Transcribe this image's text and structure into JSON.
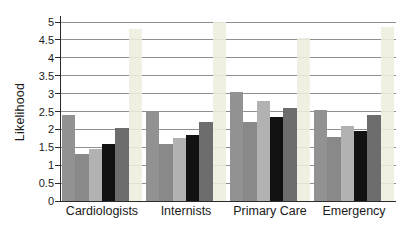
{
  "chart_data": {
    "type": "bar",
    "title": "",
    "xlabel": "",
    "ylabel": "Likelihood",
    "ylim": [
      0,
      5
    ],
    "ytick_step": 0.5,
    "ytick_labels": [
      "0",
      "0.5",
      "1",
      "1.5",
      "2",
      "2.5",
      "3",
      "3.5",
      "4",
      "4.5",
      "5"
    ],
    "grid": true,
    "legend": "none",
    "categories": [
      "Cardiologists",
      "Internists",
      "Primary Care",
      "Emergency"
    ],
    "series": [
      {
        "color": "#929292",
        "opacity": 1,
        "values": [
          2.4,
          2.5,
          3.05,
          2.55
        ]
      },
      {
        "color": "#898989",
        "opacity": 1,
        "values": [
          1.3,
          1.6,
          2.2,
          1.8
        ]
      },
      {
        "color": "#b2b2b2",
        "opacity": 1,
        "values": [
          1.45,
          1.75,
          2.8,
          2.1
        ]
      },
      {
        "color": "#121212",
        "opacity": 1,
        "values": [
          1.6,
          1.85,
          2.35,
          1.95
        ]
      },
      {
        "color": "#6d6d6d",
        "opacity": 1,
        "values": [
          2.05,
          2.2,
          2.6,
          2.4
        ]
      },
      {
        "color": "#edeedd",
        "opacity": 0.88,
        "values": [
          4.8,
          5.0,
          4.55,
          4.85
        ]
      }
    ],
    "colors": {
      "gridline": "#8f8f8f",
      "axis": "#2b2b2b",
      "text": "#1a1a1a",
      "background": "#ffffff"
    }
  }
}
